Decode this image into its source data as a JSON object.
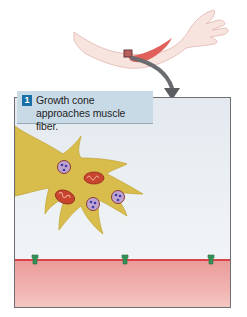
{
  "diagram": {
    "inset": {
      "subject": "arm",
      "highlighted_region": "muscle near elbow",
      "arrow": "curved arrow pointing down into detail panel"
    },
    "step": {
      "number": "1",
      "caption": "Growth cone approaches muscle fiber."
    },
    "scene": {
      "growth_cone": {
        "label": "growth cone",
        "vesicles_count": 3,
        "mitochondria_count": 2
      },
      "muscle_fiber": {
        "receptor_clusters_count": 3
      }
    },
    "colors": {
      "step_badge": "#1a6fa8",
      "step_box": "#c9dae7",
      "growth_cone": "#d9bd4e",
      "mitochondria": "#c8442f",
      "vesicle": "#b99ac8",
      "muscle": "#ee a9a6",
      "muscle_edge": "#d9454a",
      "receptor": "#3a9a5e",
      "skin": "#f7e1dc",
      "panel_bg": "#e6ebf0",
      "arrow": "#5b5d61"
    }
  }
}
